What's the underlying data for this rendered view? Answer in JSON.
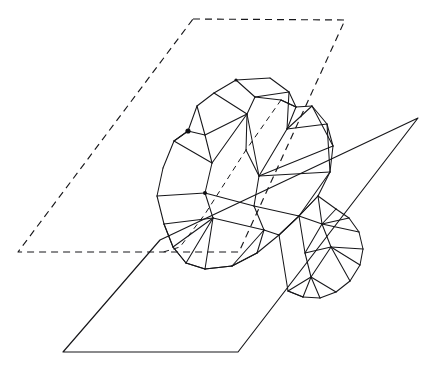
{
  "figure": {
    "background_color": "#ffffff",
    "line_color": "#17171a",
    "canvas": {
      "width": 431,
      "height": 367
    },
    "planes": [
      {
        "name": "back-plane",
        "style": "dashed",
        "points": "193,19 345,20 239,252 18,252"
      },
      {
        "name": "front-plane",
        "style": "solid",
        "points": "418,118 238,352 63,352 160,240"
      }
    ],
    "intersection_chord": {
      "name": "plane-intersection-chord",
      "style": "dashed",
      "points": "281,100 246,150 205,214 180,247 160,253"
    },
    "polyhedron": {
      "name": "polyhedron-wireframe",
      "edges": [
        "236,80 270,78",
        "270,78 289,92",
        "289,92 296,107",
        "236,80 214,93",
        "214,93 197,106",
        "197,106 188,131",
        "188,131 174,141",
        "174,141 163,168",
        "163,168 157,196",
        "157,196 164,224",
        "164,224 173,247",
        "173,247 186,263",
        "186,263 205,269",
        "205,269 232,266",
        "232,266 257,253",
        "257,253 279,235",
        "279,235 299,216",
        "299,216 318,196",
        "318,196 330,172",
        "330,172 333,146",
        "333,146 327,124",
        "327,124 312,106",
        "312,106 296,107",
        "236,80 255,97",
        "255,97 289,92",
        "255,97 247,114",
        "247,114 214,93",
        "247,114 246,150",
        "296,107 287,129",
        "287,129 312,106",
        "287,129 327,124",
        "289,92 287,129",
        "255,97 281,100",
        "281,100 296,107",
        "197,106 205,135",
        "205,135 188,131",
        "205,135 212,163",
        "212,163 247,114",
        "212,163 174,141",
        "212,163 205,193",
        "205,193 157,196",
        "205,193 213,218",
        "213,218 164,224",
        "213,218 205,269",
        "246,150 259,176",
        "259,176 287,129",
        "259,176 333,146",
        "259,176 254,206",
        "254,206 205,193",
        "254,206 264,230",
        "264,230 232,266",
        "264,230 213,218",
        "264,230 279,235",
        "254,206 299,216",
        "299,216 330,172",
        "330,172 259,176",
        "296,107 281,100",
        "312,106 333,146",
        "327,124 330,172",
        "205,135 247,114",
        "247,114 259,176",
        "188,131 174,141",
        "173,247 186,263",
        "164,224 173,247",
        "205,269 232,266",
        "186,263 205,269",
        "173,247 213,218",
        "186,263 213,218",
        "232,266 257,253",
        "257,253 264,230",
        "279,235 299,216"
      ],
      "lower_cap_edges": [
        "318,196 336,209",
        "336,209 349,218",
        "349,218 359,232",
        "359,232 363,249",
        "363,249 360,265",
        "360,265 350,281",
        "350,281 336,292",
        "336,292 320,298",
        "320,298 303,297",
        "303,297 288,291",
        "299,216 318,196",
        "336,209 322,224",
        "322,224 349,218",
        "322,224 359,232",
        "322,224 318,196",
        "322,224 299,216",
        "322,224 331,247",
        "331,247 363,249",
        "331,247 360,265",
        "331,247 350,281",
        "331,247 305,253",
        "305,253 322,224",
        "305,253 299,216",
        "305,253 311,277",
        "311,277 331,247",
        "311,277 336,292",
        "311,277 320,298",
        "311,277 303,297",
        "311,277 288,291",
        "288,291 279,235",
        "303,297 288,291"
      ],
      "marked_vertices": [
        {
          "x": 188,
          "y": 131,
          "r": 2.6
        },
        {
          "x": 236,
          "y": 80,
          "r": 1.6
        },
        {
          "x": 205,
          "y": 193,
          "r": 2.0
        }
      ]
    }
  }
}
